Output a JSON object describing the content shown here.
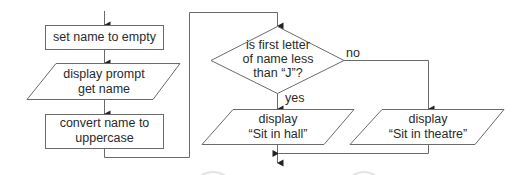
{
  "diagram": {
    "type": "flowchart",
    "colors": {
      "line": "#6a6a6a",
      "text": "#2a2a2a",
      "background": "#ffffff"
    },
    "nodes": [
      {
        "id": "set-name",
        "shape": "process",
        "lines": [
          "set name to empty"
        ]
      },
      {
        "id": "display-prompt",
        "shape": "input-output",
        "lines": [
          "display prompt",
          "get name"
        ]
      },
      {
        "id": "convert-name",
        "shape": "process",
        "lines": [
          "convert name to",
          "uppercase"
        ]
      },
      {
        "id": "decision",
        "shape": "decision",
        "lines": [
          "is first letter",
          "of name less",
          "than “J”?"
        ]
      },
      {
        "id": "display-hall",
        "shape": "input-output",
        "lines": [
          "display",
          "“Sit in hall”"
        ]
      },
      {
        "id": "display-theatre",
        "shape": "input-output",
        "lines": [
          "display",
          "“Sit in theatre”"
        ]
      }
    ],
    "edge_labels": {
      "yes": "yes",
      "no": "no"
    }
  }
}
